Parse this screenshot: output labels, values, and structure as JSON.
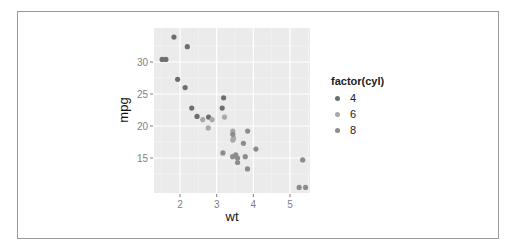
{
  "chart_data": {
    "type": "scatter",
    "title": "",
    "xlabel": "wt",
    "ylabel": "mpg",
    "x_ticks": [
      2,
      3,
      4,
      5
    ],
    "y_ticks": [
      15,
      20,
      25,
      30
    ],
    "xlim": [
      1.3,
      5.6
    ],
    "ylim": [
      9.3,
      35.2
    ],
    "grid": true,
    "legend": {
      "title": "factor(cyl)",
      "position": "right",
      "entries": [
        "4",
        "6",
        "8"
      ]
    },
    "colors": {
      "4": "#6e6e6e",
      "6": "#a8a8a8",
      "8": "#8c8c8c"
    },
    "series": [
      {
        "name": "4",
        "points": [
          [
            2.32,
            22.8
          ],
          [
            3.19,
            24.4
          ],
          [
            3.15,
            22.8
          ],
          [
            2.2,
            32.4
          ],
          [
            1.615,
            30.4
          ],
          [
            1.835,
            33.9
          ],
          [
            2.465,
            21.5
          ],
          [
            1.935,
            27.3
          ],
          [
            2.14,
            26.0
          ],
          [
            1.513,
            30.4
          ],
          [
            2.78,
            21.4
          ]
        ]
      },
      {
        "name": "6",
        "points": [
          [
            2.62,
            21.0
          ],
          [
            2.875,
            21.0
          ],
          [
            3.215,
            21.4
          ],
          [
            3.46,
            18.1
          ],
          [
            3.44,
            19.2
          ],
          [
            3.44,
            17.8
          ],
          [
            2.77,
            19.7
          ]
        ]
      },
      {
        "name": "8",
        "points": [
          [
            3.44,
            18.7
          ],
          [
            3.57,
            14.3
          ],
          [
            4.07,
            16.4
          ],
          [
            3.73,
            17.3
          ],
          [
            3.78,
            15.2
          ],
          [
            5.25,
            10.4
          ],
          [
            5.424,
            10.4
          ],
          [
            5.345,
            14.7
          ],
          [
            3.52,
            15.5
          ],
          [
            3.435,
            15.2
          ],
          [
            3.84,
            13.3
          ],
          [
            3.845,
            19.2
          ],
          [
            3.17,
            15.8
          ],
          [
            3.57,
            15.0
          ]
        ]
      }
    ]
  }
}
